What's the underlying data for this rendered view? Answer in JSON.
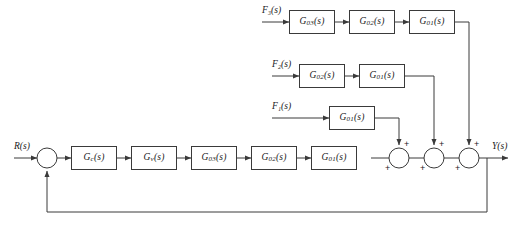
{
  "diagram": {
    "line_color": "#3a3a3a",
    "background": "#ffffff",
    "signals": {
      "reference": "R(s)",
      "output": "Y(s)",
      "disturbance_1": "F₁(s)",
      "disturbance_2": "F₂(s)",
      "disturbance_3": "F₃(s)"
    },
    "forward_path": {
      "blocks": [
        {
          "label": "G",
          "sub": "c",
          "suffix": "(s)",
          "name": "controller"
        },
        {
          "label": "G",
          "sub": "v",
          "suffix": "(s)",
          "name": "valve"
        },
        {
          "label": "G",
          "sub": "03",
          "suffix": "(s)",
          "name": "process-3"
        },
        {
          "label": "G",
          "sub": "02",
          "suffix": "(s)",
          "name": "process-2"
        },
        {
          "label": "G",
          "sub": "01",
          "suffix": "(s)",
          "name": "process-1"
        }
      ]
    },
    "branch_1": {
      "input": "F₁(s)",
      "blocks": [
        {
          "label": "G",
          "sub": "01",
          "suffix": "(s)",
          "name": "ff1-g01"
        }
      ]
    },
    "branch_2": {
      "input": "F₂(s)",
      "blocks": [
        {
          "label": "G",
          "sub": "02",
          "suffix": "(s)",
          "name": "ff2-g02"
        },
        {
          "label": "G",
          "sub": "01",
          "suffix": "(s)",
          "name": "ff2-g01"
        }
      ]
    },
    "branch_3": {
      "input": "F₃(s)",
      "blocks": [
        {
          "label": "G",
          "sub": "03",
          "suffix": "(s)",
          "name": "ff3-g03"
        },
        {
          "label": "G",
          "sub": "02",
          "suffix": "(s)",
          "name": "ff3-g02"
        },
        {
          "label": "G",
          "sub": "01",
          "suffix": "(s)",
          "name": "ff3-g01"
        }
      ]
    },
    "summing_junctions": [
      {
        "name": "feedback-summer",
        "signs": []
      },
      {
        "name": "summer-1",
        "signs": [
          "+",
          "+"
        ]
      },
      {
        "name": "summer-2",
        "signs": [
          "+",
          "+"
        ]
      },
      {
        "name": "summer-3",
        "signs": [
          "+",
          "+"
        ]
      }
    ],
    "signs": {
      "plus": "+"
    },
    "feedback": {
      "type": "unity",
      "label": ""
    }
  }
}
